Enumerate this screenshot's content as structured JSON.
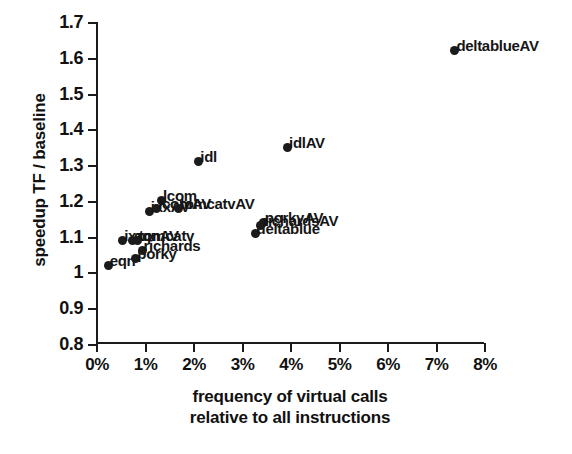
{
  "chart_data": {
    "type": "scatter",
    "title": "",
    "xlabel": "frequency of virtual calls relative to all instructions",
    "xlabel_line1": "frequency of virtual calls",
    "xlabel_line2": "relative to all instructions",
    "ylabel": "speedup TF / baseline",
    "xlim": [
      0,
      8
    ],
    "ylim": [
      0.8,
      1.7
    ],
    "xticks": [
      0,
      1,
      2,
      3,
      4,
      5,
      6,
      7,
      8
    ],
    "xtick_labels": [
      "0%",
      "1%",
      "2%",
      "3%",
      "4%",
      "5%",
      "6%",
      "7%",
      "8%"
    ],
    "yticks": [
      0.8,
      0.9,
      1.0,
      1.1,
      1.2,
      1.3,
      1.4,
      1.5,
      1.6,
      1.7
    ],
    "ytick_labels": [
      "0.8",
      "0.9",
      "1",
      "1.1",
      "1.2",
      "1.3",
      "1.4",
      "1.5",
      "1.6",
      "1.7"
    ],
    "grid": false,
    "legend": "none",
    "marker": "filled-circle",
    "marker_color": "#1b1b1b",
    "points": [
      {
        "label": "eqn",
        "x": 0.25,
        "y": 1.02
      },
      {
        "label": "ixx",
        "x": 0.55,
        "y": 1.09
      },
      {
        "label": "eqnAV",
        "x": 0.75,
        "y": 1.09
      },
      {
        "label": "tomcatv",
        "x": 0.85,
        "y": 1.09
      },
      {
        "label": "porky",
        "x": 0.82,
        "y": 1.04
      },
      {
        "label": "richards",
        "x": 0.95,
        "y": 1.06
      },
      {
        "label": "ixxAV",
        "x": 1.1,
        "y": 1.17
      },
      {
        "label": "lcom",
        "x": 1.35,
        "y": 1.2
      },
      {
        "label": "lcomAV",
        "x": 1.25,
        "y": 1.18
      },
      {
        "label": "tomcatvAV",
        "x": 1.7,
        "y": 1.18
      },
      {
        "label": "idl",
        "x": 2.12,
        "y": 1.31
      },
      {
        "label": "deltablue",
        "x": 3.28,
        "y": 1.11
      },
      {
        "label": "porkyAV",
        "x": 3.45,
        "y": 1.14
      },
      {
        "label": "richardsAV",
        "x": 3.4,
        "y": 1.13
      },
      {
        "label": "idlAV",
        "x": 3.95,
        "y": 1.35
      },
      {
        "label": "deltablueAV",
        "x": 7.4,
        "y": 1.62
      }
    ]
  }
}
